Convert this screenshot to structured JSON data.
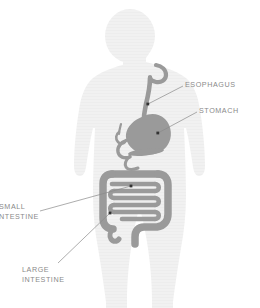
{
  "diagram": {
    "background_color": "#ffffff",
    "body_color": "#f0f0f0",
    "organ_color": "#9a9a9a",
    "leader_color": "#8a8a8a",
    "label_color": "#8a8a8a"
  },
  "labels": {
    "esophagus": {
      "text": "ESOPHAGUS"
    },
    "stomach": {
      "text": "STOMACH"
    },
    "small_intestine": {
      "line1": "SMALL",
      "line2": "NTESTINE"
    },
    "large_intestine": {
      "line1": "LARGE",
      "line2": "INTESTINE"
    }
  },
  "organs": [
    {
      "name": "esophagus",
      "label": "ESOPHAGUS"
    },
    {
      "name": "stomach",
      "label": "STOMACH"
    },
    {
      "name": "duodenum",
      "label": ""
    },
    {
      "name": "small-intestine",
      "label": "SMALL INTESTINE"
    },
    {
      "name": "large-intestine",
      "label": "LARGE INTESTINE"
    }
  ]
}
